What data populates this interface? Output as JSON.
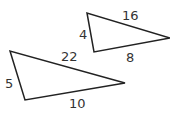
{
  "diagram": {
    "stroke_color": "#222222",
    "triangles": [
      {
        "name": "small-triangle",
        "vertices": [
          [
            87,
            13
          ],
          [
            94,
            52
          ],
          [
            170,
            38
          ]
        ],
        "sides": {
          "left": "4",
          "top": "16",
          "bottom": "8"
        }
      },
      {
        "name": "large-triangle",
        "vertices": [
          [
            10,
            51
          ],
          [
            25,
            100
          ],
          [
            125,
            83
          ]
        ],
        "sides": {
          "left": "5",
          "top": "22",
          "bottom": "10"
        }
      }
    ]
  }
}
